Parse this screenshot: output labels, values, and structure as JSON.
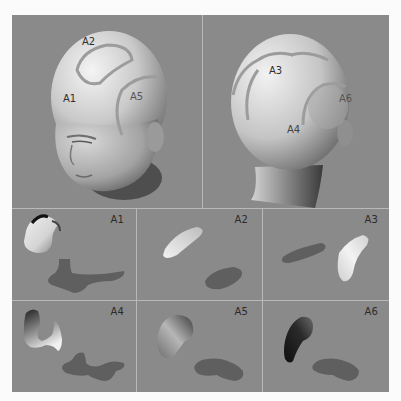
{
  "figure": {
    "top_panels": [
      {
        "id": "front-view",
        "view": "front-left oblique head",
        "region_labels": [
          {
            "text": "A2",
            "x": 82,
            "y": 36
          },
          {
            "text": "A1",
            "x": 63,
            "y": 78
          },
          {
            "text": "A5",
            "x": 130,
            "y": 77
          }
        ]
      },
      {
        "id": "back-view",
        "view": "rear-right oblique head",
        "region_labels": [
          {
            "text": "A3",
            "x": 257,
            "y": 51
          },
          {
            "text": "A6",
            "x": 326,
            "y": 81
          },
          {
            "text": "A4",
            "x": 276,
            "y": 109
          }
        ]
      }
    ],
    "patches": [
      {
        "label": "A1",
        "description": "3D patch and flattened 2D pattern"
      },
      {
        "label": "A2",
        "description": "3D patch and flattened 2D pattern"
      },
      {
        "label": "A3",
        "description": "3D patch and flattened 2D pattern"
      },
      {
        "label": "A4",
        "description": "3D patch and flattened 2D pattern"
      },
      {
        "label": "A5",
        "description": "3D patch and flattened 2D pattern"
      },
      {
        "label": "A6",
        "description": "3D patch and flattened 2D pattern"
      }
    ],
    "colors": {
      "background": "#8a8a8a",
      "divider": "#b9b9b9",
      "flat_pattern": "#5f5f5f",
      "page": "#fbfbfb"
    }
  }
}
